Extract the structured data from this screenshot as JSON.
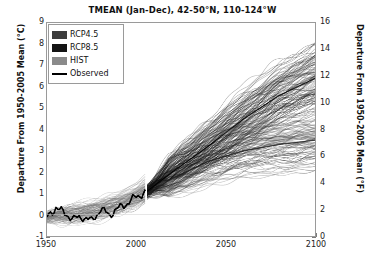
{
  "chart_data": {
    "type": "line",
    "title": "TMEAN (Jan-Dec), 42-50°N, 110-124°W",
    "xlabel": "",
    "ylabel": "Departure From 1950-2005 Mean (°C)",
    "ylabel_right": "Departure From 1950-2005 Mean (°F)",
    "xlim": [
      1950,
      2100
    ],
    "ylim": [
      -1,
      9
    ],
    "ylim_right": [
      0,
      16
    ],
    "xticks": [
      1950,
      2000,
      2050,
      2100
    ],
    "yticks": [
      -1,
      0,
      1,
      2,
      3,
      4,
      5,
      6,
      7,
      8,
      9
    ],
    "yticks_right": [
      0,
      2,
      4,
      6,
      8,
      10,
      12,
      14,
      16
    ],
    "grid": false,
    "legend_position": "upper-left",
    "historical_end_year": 2005,
    "projection_start_year": 2006,
    "legend": [
      {
        "label": "RCP4.5",
        "marker": "swatch",
        "color": "#3d3d3d"
      },
      {
        "label": "RCP8.5",
        "marker": "swatch",
        "color": "#141414"
      },
      {
        "label": "HIST",
        "marker": "swatch",
        "color": "#8a8a8a"
      },
      {
        "label": "Observed",
        "marker": "line",
        "color": "#000000"
      }
    ],
    "series": [
      {
        "name": "Observed",
        "style": "line",
        "color": "#000000",
        "x": [
          1950,
          1955,
          1960,
          1965,
          1970,
          1975,
          1980,
          1985,
          1990,
          1995,
          2000,
          2005
        ],
        "values": [
          -0.15,
          0.35,
          0.05,
          -0.2,
          -0.1,
          -0.3,
          0.25,
          0.0,
          0.3,
          0.55,
          0.85,
          1.05
        ]
      },
      {
        "name": "HIST",
        "style": "envelope",
        "color": "#8a8a8a",
        "x": [
          1950,
          1960,
          1970,
          1980,
          1990,
          2000,
          2005
        ],
        "lower": [
          -0.7,
          -0.6,
          -0.5,
          -0.4,
          -0.2,
          0.1,
          0.3
        ],
        "upper": [
          0.5,
          0.6,
          0.7,
          0.9,
          1.2,
          1.6,
          1.9
        ],
        "mean": [
          -0.1,
          0.0,
          0.1,
          0.25,
          0.5,
          0.85,
          1.1
        ]
      },
      {
        "name": "RCP4.5",
        "style": "envelope",
        "color": "#3d3d3d",
        "x": [
          2006,
          2020,
          2040,
          2060,
          2080,
          2100
        ],
        "lower": [
          0.2,
          0.6,
          1.0,
          1.3,
          1.5,
          1.6
        ],
        "upper": [
          1.9,
          2.8,
          3.9,
          4.6,
          5.1,
          5.4
        ],
        "mean": [
          1.0,
          1.7,
          2.5,
          3.0,
          3.3,
          3.5
        ]
      },
      {
        "name": "RCP8.5",
        "style": "envelope",
        "color": "#141414",
        "x": [
          2006,
          2020,
          2040,
          2060,
          2080,
          2100
        ],
        "lower": [
          0.3,
          0.9,
          1.7,
          2.6,
          3.4,
          4.1
        ],
        "upper": [
          2.0,
          3.2,
          4.9,
          6.4,
          7.6,
          8.6
        ],
        "mean": [
          1.1,
          2.0,
          3.2,
          4.5,
          5.6,
          6.4
        ]
      }
    ]
  }
}
